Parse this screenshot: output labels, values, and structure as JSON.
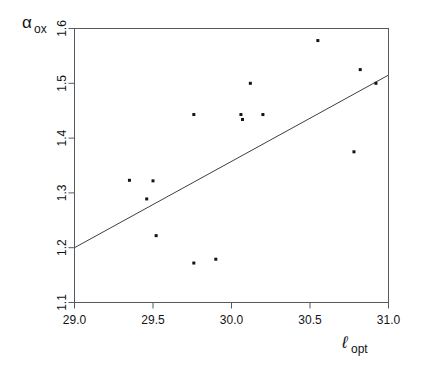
{
  "chart_data": {
    "type": "scatter",
    "title": "",
    "subtitle": "",
    "xlabel": "l_opt",
    "ylabel": "alpha_ox",
    "xlabel_base": "ℓ",
    "xlabel_sub": "opt",
    "ylabel_base": "α",
    "ylabel_sub": "ox",
    "xlim": [
      29.0,
      31.0
    ],
    "ylim": [
      1.1,
      1.6
    ],
    "xticks": [
      29.0,
      29.5,
      30.0,
      30.5,
      31.0
    ],
    "xtick_labels": [
      "29.0",
      "29.5",
      "30.0",
      "30.5",
      "31.0"
    ],
    "yticks": [
      1.1,
      1.2,
      1.3,
      1.4,
      1.5,
      1.6
    ],
    "ytick_labels": [
      "1.1",
      "1.2",
      "1.3",
      "1.4",
      "1.5",
      "1.6"
    ],
    "grid": false,
    "legend": false,
    "legend_position": "none",
    "marker": "square",
    "marker_size_px": 3,
    "point_color": "#111416",
    "line_color": "#3b3f44",
    "frame_color": "#555a60",
    "background_color": "#ffffff",
    "x": [
      29.35,
      29.46,
      29.5,
      29.52,
      29.76,
      29.9,
      30.06,
      30.07,
      30.12,
      30.2,
      30.24,
      30.55,
      30.78,
      30.82,
      30.92
    ],
    "y": [
      1.323,
      1.289,
      1.322,
      1.222,
      1.172,
      1.179,
      1.443,
      1.5,
      1.434,
      1.443,
      1.578,
      1.375,
      1.525,
      1.5,
      1.443
    ],
    "points": [
      {
        "x": 29.35,
        "y": 1.323
      },
      {
        "x": 29.46,
        "y": 1.289
      },
      {
        "x": 29.5,
        "y": 1.322
      },
      {
        "x": 29.52,
        "y": 1.222
      },
      {
        "x": 29.76,
        "y": 1.172
      },
      {
        "x": 29.9,
        "y": 1.179
      },
      {
        "x": 30.06,
        "y": 1.443
      },
      {
        "x": 30.12,
        "y": 1.5
      },
      {
        "x": 30.07,
        "y": 1.434
      },
      {
        "x": 30.2,
        "y": 1.443
      },
      {
        "x": 30.55,
        "y": 1.578
      },
      {
        "x": 30.78,
        "y": 1.375
      },
      {
        "x": 30.82,
        "y": 1.525
      },
      {
        "x": 30.92,
        "y": 1.5
      },
      {
        "x": 29.76,
        "y": 1.443
      }
    ],
    "fit_line": {
      "name": "linear regression",
      "x_start": 29.0,
      "y_start": 1.2,
      "x_end": 31.0,
      "y_end": 1.515,
      "slope": 0.1575,
      "intercept": -3.3675
    }
  }
}
